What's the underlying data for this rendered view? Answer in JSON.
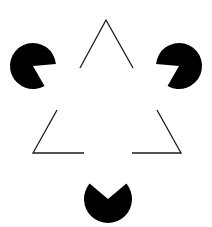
{
  "figure": {
    "background": "#ffffff",
    "ink_color": "#000000",
    "line_color": "#1a1a1a",
    "pacmen": [
      {
        "name": "left",
        "cx": 33,
        "cy": 66,
        "r": 23,
        "mouth_direction": "lower-right"
      },
      {
        "name": "right",
        "cx": 179,
        "cy": 66,
        "r": 23,
        "mouth_direction": "lower-left"
      },
      {
        "name": "bottom",
        "cx": 108,
        "cy": 199,
        "r": 24,
        "mouth_direction": "up"
      }
    ],
    "outline_triangle": {
      "apex": [
        106,
        20
      ],
      "bottom_left": [
        33,
        153
      ],
      "bottom_right": [
        181,
        153
      ]
    }
  }
}
